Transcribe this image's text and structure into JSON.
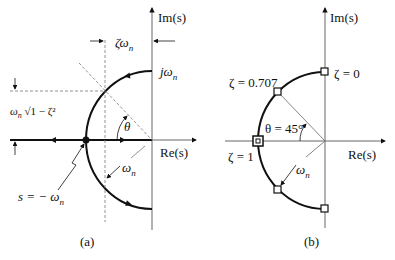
{
  "panel_a": {
    "caption": "(a)",
    "im_axis": "Im(s)",
    "re_axis": "Re(s)",
    "zeta_omega_n": "ζω",
    "j_omega_n": "jω",
    "omega_n_sqrt": "ω",
    "sqrt_text": "√1 − ζ²",
    "theta": "θ",
    "omega_n_radius": "ω",
    "pole_label": "s = − ω",
    "sub_n": "n"
  },
  "panel_b": {
    "caption": "(b)",
    "im_axis": "Im(s)",
    "re_axis": "Re(s)",
    "zeta_0707": "ζ = 0.707",
    "zeta_0": "ζ = 0",
    "zeta_1": "ζ = 1",
    "theta_45": "θ = 45°",
    "omega_n_radius": "ω",
    "sub_n": "n"
  },
  "colors": {
    "curve": "#111111",
    "axis": "#555555",
    "dashed": "#777777"
  }
}
